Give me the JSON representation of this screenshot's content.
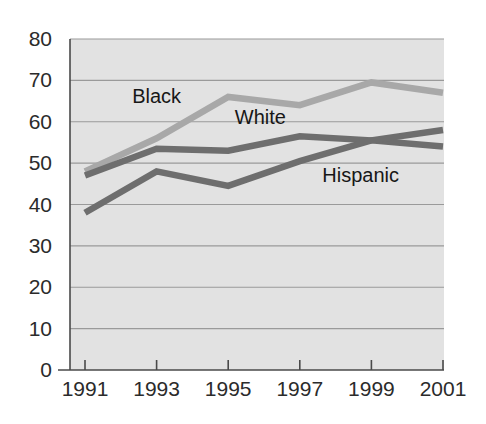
{
  "chart_data": {
    "type": "line",
    "title": "",
    "subtitle": "",
    "xlabel": "",
    "ylabel": "",
    "categories": [
      "1991",
      "1993",
      "1995",
      "1997",
      "1999",
      "2001"
    ],
    "x": [
      1991,
      1993,
      1995,
      1997,
      1999,
      2001
    ],
    "xlim": [
      1990.5,
      2001.5
    ],
    "ylim": [
      0,
      80
    ],
    "ytick_labels": [
      "0",
      "10",
      "20",
      "30",
      "40",
      "50",
      "60",
      "70",
      "80"
    ],
    "ytick_values": [
      0,
      10,
      20,
      30,
      40,
      50,
      60,
      70,
      80
    ],
    "xtick_labels": [
      "1991",
      "1993",
      "1995",
      "1997",
      "1999",
      "2001"
    ],
    "grid": "horizontal",
    "legend_position": "inline-annotations",
    "plot_background": "#e2e2e2",
    "grid_color": "#9a9a9a",
    "axis_color": "#4a4a4a",
    "series": [
      {
        "name": "Black",
        "color": "#a8a8a8",
        "values": [
          48,
          56,
          66,
          64,
          69.5,
          67
        ],
        "label_x": 1993.0,
        "label_y": 64.5
      },
      {
        "name": "White",
        "color": "#6e6e6e",
        "values": [
          47,
          53.5,
          53,
          56.5,
          55.5,
          54
        ],
        "label_x": 1995.9,
        "label_y": 59.5
      },
      {
        "name": "Hispanic",
        "color": "#6e6e6e",
        "values": [
          38,
          48,
          44.5,
          50.5,
          55.5,
          58
        ],
        "label_x": 1998.7,
        "label_y": 45.5
      }
    ]
  },
  "annotations": {
    "black_label": "Black",
    "white_label": "White",
    "hispanic_label": "Hispanic"
  }
}
